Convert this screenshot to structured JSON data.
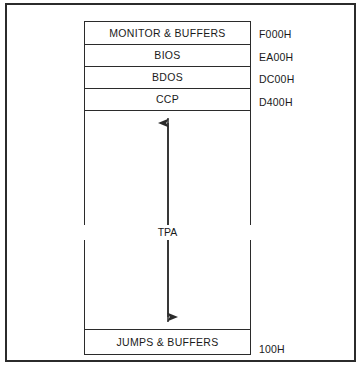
{
  "figure": {
    "type": "memory-map-diagram"
  },
  "memory_map": {
    "blocks": [
      {
        "id": "monitor",
        "label": "MONITOR & BUFFERS"
      },
      {
        "id": "bios",
        "label": "BIOS"
      },
      {
        "id": "bdos",
        "label": "BDOS"
      },
      {
        "id": "ccp",
        "label": "CCP"
      },
      {
        "id": "tpa",
        "label": "TPA"
      },
      {
        "id": "jumps",
        "label": "JUMPS & BUFFERS"
      }
    ],
    "addresses": [
      {
        "id": "f000",
        "value": "F000H"
      },
      {
        "id": "ea00",
        "value": "EA00H"
      },
      {
        "id": "dc00",
        "value": "DC00H"
      },
      {
        "id": "d400",
        "value": "D400H"
      },
      {
        "id": "100",
        "value": "100H"
      }
    ],
    "tpa_label": "TPA"
  },
  "colors": {
    "line": "#2b2b2b",
    "background": "#ffffff",
    "text": "#1a1a1a"
  }
}
